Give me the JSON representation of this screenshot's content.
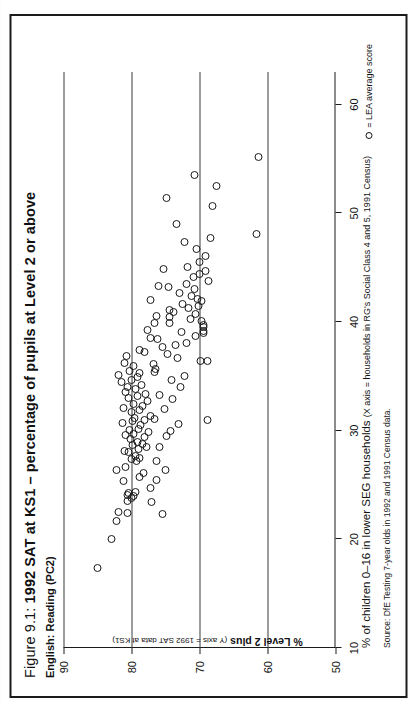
{
  "figure": {
    "number_prefix": "Figure 9.1:",
    "title": "1992 SAT at KS1 – percentage of pupils at Level 2 or above",
    "subtitle": "English: Reading (PC2)"
  },
  "legend": {
    "marker": "circle-marker",
    "text": "= LEA average score"
  },
  "source": "Source: DfE Testing 7-year olds in 1992 and 1991 Census data.",
  "chart_data": {
    "type": "scatter",
    "title": "1992 SAT at KS1 – percentage of pupils at Level 2 or above",
    "subtitle": "English: Reading (PC2)",
    "xlabel": "% of children 0–16 in lower SEG households",
    "xlabel_note": "(X axis = households in RG's Social Class 4 and 5, 1991 Census)",
    "ylabel": "% Level 2 plus",
    "ylabel_note": "(Y axis = 1992 SAT data at KS1)",
    "xlim": [
      10,
      63
    ],
    "ylim": [
      50,
      90
    ],
    "xticks": [
      10,
      20,
      30,
      40,
      50,
      60
    ],
    "yticks": [
      50,
      60,
      70,
      80,
      90
    ],
    "gridlines_y": [
      60,
      70,
      80,
      90
    ],
    "grid": true,
    "legend_position": "bottom-right",
    "series_name": "LEA average score",
    "points": [
      [
        17.3,
        85.2
      ],
      [
        19.9,
        83.1
      ],
      [
        21.6,
        82.3
      ],
      [
        22.4,
        82.0
      ],
      [
        22.3,
        80.7
      ],
      [
        23.4,
        80.8
      ],
      [
        23.7,
        80.2
      ],
      [
        23.9,
        79.9
      ],
      [
        24.0,
        80.7
      ],
      [
        24.2,
        80.6
      ],
      [
        24.3,
        79.5
      ],
      [
        25.3,
        81.3
      ],
      [
        25.6,
        79.0
      ],
      [
        26.0,
        78.4
      ],
      [
        26.3,
        82.4
      ],
      [
        26.6,
        81.0
      ],
      [
        27.1,
        79.4
      ],
      [
        27.3,
        80.2
      ],
      [
        27.4,
        78.9
      ],
      [
        27.6,
        79.6
      ],
      [
        27.9,
        80.6
      ],
      [
        28.0,
        81.2
      ],
      [
        28.2,
        79.1
      ],
      [
        28.4,
        78.0
      ],
      [
        28.6,
        80.0
      ],
      [
        28.7,
        78.6
      ],
      [
        28.9,
        79.2
      ],
      [
        29.1,
        80.3
      ],
      [
        29.3,
        78.2
      ],
      [
        29.5,
        81.0
      ],
      [
        29.6,
        79.8
      ],
      [
        29.8,
        77.6
      ],
      [
        30.0,
        80.4
      ],
      [
        30.1,
        79.1
      ],
      [
        30.4,
        78.8
      ],
      [
        30.6,
        81.5
      ],
      [
        30.8,
        80.0
      ],
      [
        30.9,
        78.3
      ],
      [
        31.1,
        79.7
      ],
      [
        31.3,
        77.4
      ],
      [
        31.6,
        80.2
      ],
      [
        31.8,
        79.0
      ],
      [
        32.0,
        81.3
      ],
      [
        32.2,
        78.5
      ],
      [
        32.4,
        79.9
      ],
      [
        32.6,
        77.8
      ],
      [
        32.9,
        80.6
      ],
      [
        33.1,
        79.3
      ],
      [
        33.3,
        78.1
      ],
      [
        33.5,
        81.0
      ],
      [
        33.7,
        79.6
      ],
      [
        33.9,
        80.8
      ],
      [
        34.1,
        78.7
      ],
      [
        34.4,
        81.6
      ],
      [
        34.6,
        80.1
      ],
      [
        34.8,
        79.2
      ],
      [
        35.0,
        82.0
      ],
      [
        35.2,
        78.9
      ],
      [
        35.4,
        80.4
      ],
      [
        35.6,
        76.6
      ],
      [
        35.9,
        79.8
      ],
      [
        36.1,
        81.2
      ],
      [
        36.3,
        70.0
      ],
      [
        36.6,
        73.4
      ],
      [
        36.8,
        80.9
      ],
      [
        37.0,
        74.8
      ],
      [
        37.3,
        79.0
      ],
      [
        37.6,
        75.6
      ],
      [
        38.0,
        72.1
      ],
      [
        38.3,
        76.3
      ],
      [
        38.6,
        70.8
      ],
      [
        38.9,
        69.6
      ],
      [
        39.1,
        69.6
      ],
      [
        39.4,
        69.6
      ],
      [
        39.6,
        69.6
      ],
      [
        39.8,
        74.6
      ],
      [
        40.0,
        69.9
      ],
      [
        40.2,
        71.4
      ],
      [
        40.4,
        74.6
      ],
      [
        40.6,
        70.7
      ],
      [
        40.8,
        73.9
      ],
      [
        41.0,
        74.6
      ],
      [
        41.2,
        71.8
      ],
      [
        41.4,
        70.3
      ],
      [
        41.6,
        72.6
      ],
      [
        41.8,
        69.8
      ],
      [
        42.0,
        70.5
      ],
      [
        42.3,
        71.3
      ],
      [
        42.6,
        73.1
      ],
      [
        42.9,
        70.9
      ],
      [
        43.1,
        74.7
      ],
      [
        43.4,
        72.0
      ],
      [
        43.7,
        68.8
      ],
      [
        44.0,
        71.0
      ],
      [
        44.3,
        70.1
      ],
      [
        44.6,
        69.3
      ],
      [
        45.0,
        71.9
      ],
      [
        45.4,
        70.2
      ],
      [
        46.0,
        69.3
      ],
      [
        46.6,
        70.6
      ],
      [
        47.3,
        72.3
      ],
      [
        47.6,
        68.6
      ],
      [
        48.0,
        61.8
      ],
      [
        48.9,
        73.5
      ],
      [
        50.6,
        68.2
      ],
      [
        51.3,
        75.0
      ],
      [
        52.4,
        67.6
      ],
      [
        53.4,
        70.9
      ],
      [
        55.1,
        61.5
      ],
      [
        30.9,
        68.9
      ],
      [
        36.3,
        68.9
      ],
      [
        27.1,
        76.5
      ],
      [
        28.4,
        76.1
      ],
      [
        29.4,
        75.0
      ],
      [
        31.0,
        76.7
      ],
      [
        31.9,
        75.3
      ],
      [
        32.8,
        74.1
      ],
      [
        33.2,
        76.0
      ],
      [
        34.6,
        74.2
      ],
      [
        35.3,
        76.8
      ],
      [
        26.3,
        75.2
      ],
      [
        25.4,
        76.4
      ],
      [
        24.6,
        77.3
      ],
      [
        23.3,
        77.2
      ],
      [
        22.2,
        75.6
      ],
      [
        29.9,
        74.4
      ],
      [
        30.5,
        73.2
      ],
      [
        33.9,
        73.0
      ],
      [
        34.9,
        72.4
      ],
      [
        37.1,
        78.2
      ],
      [
        38.4,
        77.4
      ],
      [
        39.2,
        77.8
      ],
      [
        39.8,
        76.8
      ],
      [
        41.9,
        77.3
      ],
      [
        43.2,
        76.2
      ],
      [
        44.8,
        75.4
      ],
      [
        36.0,
        76.9
      ],
      [
        37.8,
        73.7
      ],
      [
        39.0,
        72.8
      ],
      [
        40.5,
        76.4
      ]
    ]
  }
}
